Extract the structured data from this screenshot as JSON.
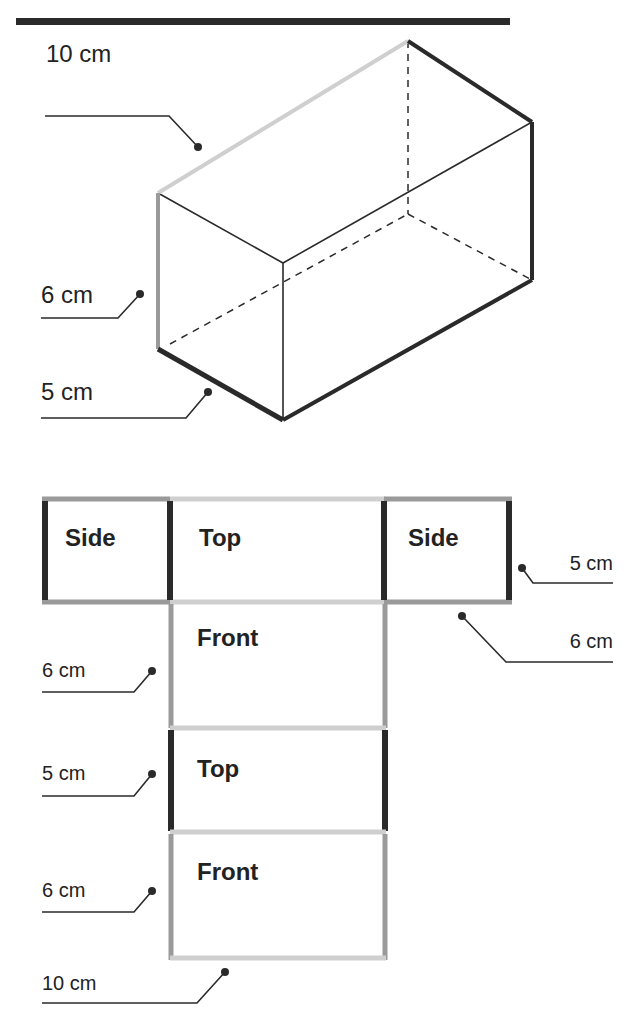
{
  "figure": {
    "colors": {
      "dark_edge": "#2a2a2a",
      "mid_edge": "#9a9a9a",
      "light_edge": "#cfcfcf",
      "text": "#222222",
      "header_bar": "#2a2a2a"
    },
    "prism": {
      "labels": {
        "length": "10 cm",
        "height": "6 cm",
        "width": "5 cm"
      }
    },
    "net": {
      "faces": [
        {
          "label": "Side"
        },
        {
          "label": "Top"
        },
        {
          "label": "Side"
        },
        {
          "label": "Front"
        },
        {
          "label": "Top"
        },
        {
          "label": "Front"
        }
      ],
      "labels": {
        "side_width": "5 cm",
        "side_height": "6 cm",
        "front1_height": "6 cm",
        "top2_height": "5 cm",
        "front2_height": "6 cm",
        "bottom_length": "10 cm"
      }
    }
  }
}
